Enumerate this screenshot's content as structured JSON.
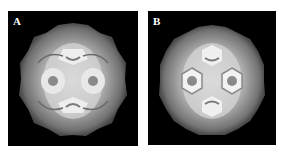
{
  "figure": {
    "panels": [
      {
        "label": "A",
        "description": "Icosahedral virus capsid surface rendering, gray on black, two-fold view with pentameric/hexameric capsomers"
      },
      {
        "label": "B",
        "description": "Icosahedral virus capsid surface rendering, gray on black, more pronounced hexameric rings"
      }
    ],
    "colors": {
      "background": "#000000",
      "capsid_light": "#e6e6e6",
      "capsid_mid": "#9a9a9a",
      "capsid_dark": "#5a5a5a"
    }
  }
}
